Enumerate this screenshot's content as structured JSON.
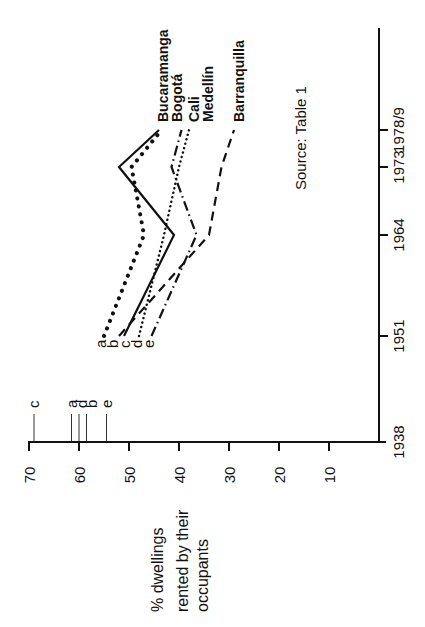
{
  "chart_data": {
    "type": "line",
    "orientation": "rotated-90-ccw",
    "title": "",
    "ylabel": "% dwellings rented by their occupants",
    "ylabel_lines": [
      "% dwellings",
      "rented  by  their",
      "occupants"
    ],
    "xlabel": "",
    "ylim": [
      0,
      70
    ],
    "y_ticks": [
      10,
      20,
      30,
      40,
      50,
      60,
      70
    ],
    "x": [
      "1938",
      "1951",
      "1964",
      "1973",
      "1978/9"
    ],
    "x_positions": [
      1938,
      1951,
      1964,
      1973,
      1978.5
    ],
    "grid": false,
    "source_note": "Source:  Table 1",
    "series": [
      {
        "name": "Bucaramanga",
        "code": "c",
        "style": "solid",
        "values": [
          69,
          51,
          41,
          52,
          44
        ]
      },
      {
        "name": "Bogotá",
        "code": "a",
        "style": "dotted-large",
        "values": [
          61.5,
          55,
          47,
          49.5,
          43.5
        ]
      },
      {
        "name": "Cali",
        "code": "e",
        "style": "dash-dot",
        "values": [
          54.5,
          45.5,
          36.5,
          41.5,
          39.5
        ]
      },
      {
        "name": "Medellín",
        "code": "d",
        "style": "dotted-small",
        "values": [
          60,
          48,
          43,
          40,
          38
        ]
      },
      {
        "name": "Barranquilla",
        "code": "b",
        "style": "dashed",
        "values": [
          58.5,
          52,
          34,
          31.5,
          29
        ]
      }
    ],
    "series_1938_markers": [
      {
        "code": "c",
        "value": 69
      },
      {
        "code": "a",
        "value": 61.5
      },
      {
        "code": "d",
        "value": 60
      },
      {
        "code": "b",
        "value": 58.5
      },
      {
        "code": "e",
        "value": 54.5
      }
    ],
    "series_1951_labels": [
      "a",
      "b",
      "c",
      "d",
      "e"
    ],
    "end_labels_order": [
      "Bucaramanga",
      "Bogotá",
      "Cali",
      "Medellín",
      "Barranquilla"
    ]
  }
}
